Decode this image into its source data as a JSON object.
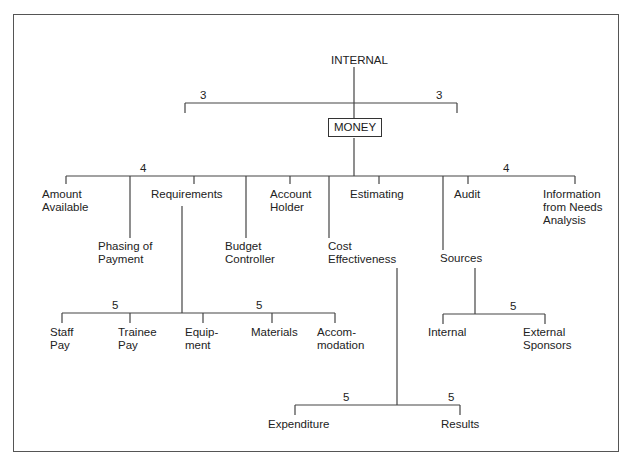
{
  "diagram": {
    "root": "INTERNAL",
    "center": "MONEY",
    "level1_weights": {
      "left": "3",
      "right": "3"
    },
    "level2_weights": {
      "left": "4",
      "right": "4"
    },
    "level2": [
      {
        "label": "Amount\nAvailable"
      },
      {
        "label": "Phasing of\nPayment"
      },
      {
        "label": "Requirements"
      },
      {
        "label": "Budget\nController"
      },
      {
        "label": "Account\nHolder"
      },
      {
        "label": "Cost\nEffectiveness"
      },
      {
        "label": "Estimating"
      },
      {
        "label": "Sources"
      },
      {
        "label": "Audit"
      },
      {
        "label": "Information\nfrom Needs\nAnalysis"
      }
    ],
    "requirements_children": {
      "weights": {
        "left": "5",
        "right": "5"
      },
      "items": [
        "Staff\nPay",
        "Trainee\nPay",
        "Equip-\nment",
        "Materials",
        "Accom-\nmodation"
      ]
    },
    "sources_children": {
      "weight": "5",
      "items": [
        "Internal",
        "External\nSponsors"
      ]
    },
    "cost_effectiveness_children": {
      "weights": {
        "left": "5",
        "right": "5"
      },
      "items": [
        "Expenditure",
        "Results"
      ]
    }
  }
}
